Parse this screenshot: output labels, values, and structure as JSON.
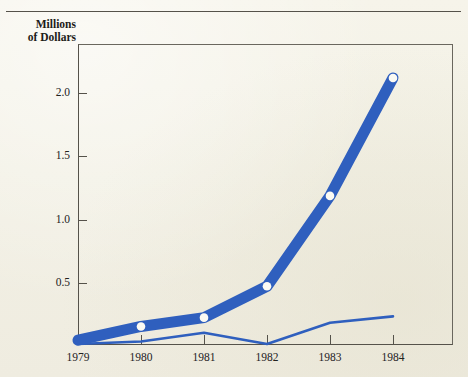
{
  "page": {
    "cut_off_header_text": "",
    "background_color": "#f3f1e6"
  },
  "chart_data": {
    "type": "line",
    "title": "",
    "ylabel": "Millions of Dollars",
    "xlabel": "",
    "categories": [
      "1979",
      "1980",
      "1981",
      "1982",
      "1983",
      "1984"
    ],
    "x": [
      1979,
      1980,
      1981,
      1982,
      1983,
      1984
    ],
    "ylim": [
      0,
      2.4
    ],
    "xlim": [
      1979,
      1984
    ],
    "yticks": [
      "0.5",
      "1.0",
      "1.5",
      "2.0"
    ],
    "ytick_values": [
      0.5,
      1.0,
      1.5,
      2.0
    ],
    "grid": false,
    "legend": "none",
    "accent_color": "#2f5fbe",
    "series": [
      {
        "name": "thick-series",
        "style": "thick-band-with-markers",
        "marker": "white-circle",
        "values": [
          0.03,
          0.14,
          0.21,
          0.46,
          1.18,
          2.12
        ]
      },
      {
        "name": "thin-series",
        "style": "thin-line",
        "marker": "none",
        "values": [
          0.0,
          0.02,
          0.09,
          0.0,
          0.17,
          0.22
        ]
      }
    ]
  },
  "axis": {
    "y_title_line1": "Millions",
    "y_title_line2": "of Dollars"
  }
}
